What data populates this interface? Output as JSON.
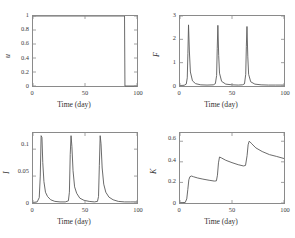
{
  "figure": {
    "background": "#ffffff",
    "line_color": "#5a5a5a",
    "axis_color": "#8a8a8a"
  },
  "chart_data": [
    {
      "id": "panel-u",
      "type": "line",
      "title": "",
      "xlabel": "Time (day)",
      "ylabel": "u",
      "xlim": [
        0,
        100
      ],
      "ylim": [
        0,
        1
      ],
      "xticks": [
        0,
        50,
        100
      ],
      "xticklabels": [
        "0",
        "50",
        "100"
      ],
      "yticks": [
        0,
        0.2,
        0.4,
        0.6,
        0.8,
        1
      ],
      "yticklabels": [
        "0",
        "0.2",
        "0.4",
        "0.6",
        "0.8",
        "1"
      ],
      "grid": false,
      "legend": null,
      "series": [
        {
          "name": "u(t)",
          "x": [
            0,
            88,
            88.4,
            100
          ],
          "values": [
            1,
            1,
            0,
            0
          ]
        }
      ],
      "description": "Control u stays at 1 from day 0 until about day 88, then drops sharply to 0 and remains 0 until day 100."
    },
    {
      "id": "panel-F",
      "type": "line",
      "title": "",
      "xlabel": "Time (day)",
      "ylabel": "F",
      "xlim": [
        0,
        100
      ],
      "ylim": [
        0,
        3
      ],
      "xticks": [
        0,
        50,
        100
      ],
      "xticklabels": [
        "0",
        "50",
        "100"
      ],
      "yticks": [
        0,
        1,
        2,
        3
      ],
      "yticklabels": [
        "0",
        "1",
        "2",
        "3"
      ],
      "grid": false,
      "legend": null,
      "series": [
        {
          "name": "F(t)",
          "x": [
            0,
            4,
            6,
            7,
            7.6,
            8.2,
            9,
            10,
            12,
            15,
            20,
            26,
            32,
            34,
            35.2,
            35.8,
            36.4,
            37.2,
            38,
            40,
            44,
            50,
            56,
            60,
            62,
            63.2,
            63.8,
            64.4,
            65.2,
            66,
            68,
            72,
            78,
            85,
            92,
            100
          ],
          "values": [
            0.02,
            0.03,
            0.08,
            0.35,
            1.4,
            2.62,
            1.5,
            0.6,
            0.22,
            0.1,
            0.05,
            0.04,
            0.05,
            0.1,
            0.45,
            1.6,
            2.6,
            1.3,
            0.55,
            0.2,
            0.08,
            0.05,
            0.04,
            0.05,
            0.09,
            0.5,
            1.7,
            2.55,
            1.25,
            0.5,
            0.18,
            0.08,
            0.05,
            0.04,
            0.04,
            0.04
          ]
        }
      ],
      "description": "F exhibits three tall narrow spikes reaching about 2.6 at roughly days 8, 36 and 64, with near-zero baseline between spikes."
    },
    {
      "id": "panel-I",
      "type": "line",
      "title": "",
      "xlabel": "Time (day)",
      "ylabel": "I",
      "xlim": [
        0,
        100
      ],
      "ylim": [
        0,
        0.13
      ],
      "xticks": [
        0,
        50,
        100
      ],
      "xticklabels": [
        "0",
        "50",
        "100"
      ],
      "yticks": [
        0,
        0.05,
        0.1
      ],
      "yticklabels": [
        "0",
        "0.05",
        "0.1"
      ],
      "grid": false,
      "legend": null,
      "series": [
        {
          "name": "I(t)",
          "x": [
            0,
            4,
            6,
            7,
            7.8,
            8.6,
            9.4,
            10.5,
            12,
            14,
            17,
            21,
            26,
            31,
            34,
            35,
            35.8,
            36.6,
            37.4,
            38.5,
            40,
            42,
            45,
            49,
            54,
            59,
            62,
            63,
            63.8,
            64.6,
            65.4,
            66.5,
            68,
            70,
            73,
            77,
            82,
            88,
            94,
            100
          ],
          "values": [
            0.001,
            0.002,
            0.01,
            0.05,
            0.125,
            0.122,
            0.075,
            0.04,
            0.02,
            0.012,
            0.006,
            0.003,
            0.002,
            0.002,
            0.004,
            0.02,
            0.09,
            0.125,
            0.105,
            0.06,
            0.03,
            0.018,
            0.009,
            0.005,
            0.003,
            0.002,
            0.003,
            0.012,
            0.07,
            0.125,
            0.11,
            0.065,
            0.035,
            0.02,
            0.011,
            0.006,
            0.003,
            0.002,
            0.002,
            0.002
          ]
        }
      ],
      "description": "Infected fraction I shows three sharp outbreaks peaking near 0.125 at about days 8, 37 and 65, each followed by an exponential-like decay back toward zero."
    },
    {
      "id": "panel-K",
      "type": "line",
      "title": "",
      "xlabel": "Time (day)",
      "ylabel": "K",
      "xlim": [
        0,
        100
      ],
      "ylim": [
        0,
        0.68
      ],
      "xticks": [
        0,
        50,
        100
      ],
      "xticklabels": [
        "0",
        "50",
        "100"
      ],
      "yticks": [
        0,
        0.2,
        0.4,
        0.6
      ],
      "yticklabels": [
        "0",
        "0.2",
        "0.4",
        "0.6"
      ],
      "grid": false,
      "legend": null,
      "series": [
        {
          "name": "K(t)",
          "x": [
            0,
            5,
            6.5,
            7.5,
            8.5,
            9.5,
            11,
            13,
            17,
            22,
            28,
            33,
            35,
            36,
            37,
            38,
            40,
            44,
            50,
            56,
            61,
            63,
            64.5,
            65.5,
            66.5,
            67.5,
            69,
            73,
            79,
            86,
            93,
            100
          ],
          "values": [
            0.005,
            0.005,
            0.04,
            0.13,
            0.225,
            0.255,
            0.262,
            0.255,
            0.243,
            0.232,
            0.221,
            0.213,
            0.215,
            0.27,
            0.39,
            0.447,
            0.437,
            0.415,
            0.392,
            0.372,
            0.36,
            0.365,
            0.46,
            0.565,
            0.6,
            0.592,
            0.575,
            0.535,
            0.5,
            0.47,
            0.452,
            0.432
          ]
        }
      ],
      "description": "Cumulative quantity K rises in a staircase: jumps to about 0.26 near day 9 then slowly decays to 0.21, jumps to about 0.45 near day 38 then decays to 0.36, jumps to about 0.60 near day 66 then decays to about 0.43 by day 100."
    }
  ]
}
